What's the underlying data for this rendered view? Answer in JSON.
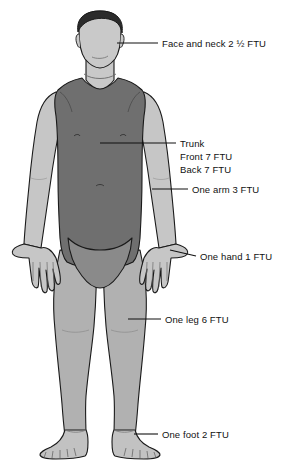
{
  "diagram": {
    "colors": {
      "hair": "#2b2b2b",
      "face": "#c9c9c9",
      "trunk": "#6f6f6f",
      "arms": "#c6c6c6",
      "legs": "#b1b1b1",
      "feet": "#c2c2c2",
      "groin": "#8a8a8a",
      "outline": "#1a1a1a",
      "leader_line": "#111111",
      "text": "#111111",
      "background": "#ffffff"
    },
    "labels": [
      {
        "id": "face-and-neck",
        "text": "Face and neck 2 ½ FTU",
        "region": "face and neck",
        "amount": "2 ½ FTU",
        "x": 162,
        "y": 36
      },
      {
        "id": "trunk",
        "line1": "Trunk",
        "line2": "Front 7 FTU",
        "line3": "Back 7 FTU",
        "region": "trunk",
        "amount_front": "7 FTU",
        "amount_back": "7 FTU",
        "x": 180,
        "y": 136
      },
      {
        "id": "one-arm",
        "text": "One arm 3 FTU",
        "region": "one arm",
        "amount": "3 FTU",
        "x": 192,
        "y": 182
      },
      {
        "id": "one-hand",
        "text": "One hand 1 FTU",
        "region": "one hand",
        "amount": "1 FTU",
        "x": 200,
        "y": 246
      },
      {
        "id": "one-leg",
        "text": "One leg 6 FTU",
        "region": "one leg",
        "amount": "6 FTU",
        "x": 165,
        "y": 312
      },
      {
        "id": "one-foot",
        "text": "One foot 2 FTU",
        "region": "one foot",
        "amount": "2 FTU",
        "x": 162,
        "y": 427
      }
    ],
    "leader_lines": [
      {
        "id": "leader-face",
        "x1": 117,
        "y1": 43,
        "x2": 158,
        "y2": 43
      },
      {
        "id": "leader-trunk",
        "x1": 100,
        "y1": 143,
        "x2": 176,
        "y2": 143
      },
      {
        "id": "leader-arm",
        "x1": 152,
        "y1": 189,
        "x2": 188,
        "y2": 189
      },
      {
        "id": "leader-hand",
        "x1": 170,
        "y1": 250,
        "x2": 196,
        "y2": 256
      },
      {
        "id": "leader-leg",
        "x1": 128,
        "y1": 319,
        "x2": 161,
        "y2": 319
      },
      {
        "id": "leader-foot",
        "x1": 134,
        "y1": 434,
        "x2": 158,
        "y2": 434
      }
    ]
  }
}
